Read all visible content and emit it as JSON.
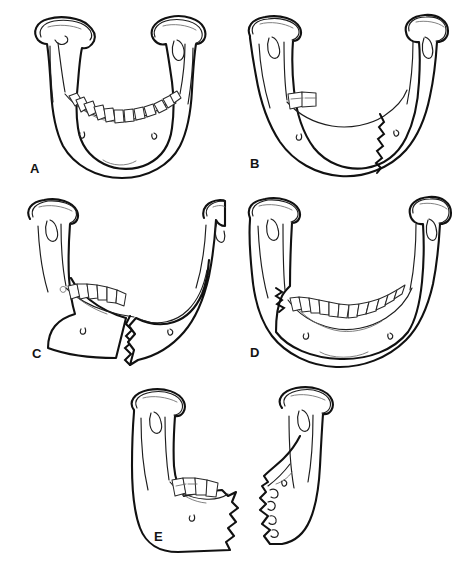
{
  "figure": {
    "background_color": "#ffffff",
    "ink_color": "#111111",
    "top_strip_text": ""
  },
  "panels": [
    {
      "id": "A",
      "label": "A",
      "caption": "Intact dentate mandible, frontal view",
      "dentition": "full",
      "tooth_count": 14,
      "fracture": "none",
      "fragments": 1
    },
    {
      "id": "B",
      "label": "B",
      "caption": "Edentulous mandible with oblique body fracture, two remaining molars",
      "dentition": "edentulous-with-two-molars",
      "tooth_count": 2,
      "fracture": "right-body-oblique",
      "fragments": 2
    },
    {
      "id": "C",
      "label": "C",
      "caption": "Partially dentate mandible with displaced parasymphyseal fracture",
      "dentition": "partial-left",
      "tooth_count": 6,
      "fracture": "parasymphyseal-displaced",
      "fragments": 2
    },
    {
      "id": "D",
      "label": "D",
      "caption": "Dentate mandible with left angle / ramus fracture",
      "dentition": "full",
      "tooth_count": 14,
      "fracture": "left-angle-ramus",
      "fragments": 2
    },
    {
      "id": "E",
      "label": "E",
      "caption": "Lateral views of two separated mandibular fragments, comminuted edges",
      "dentition": "partial-posterior",
      "tooth_count": 4,
      "fracture": "segmental-comminuted",
      "fragments": 2
    }
  ],
  "labels": {
    "a": "A",
    "b": "B",
    "c": "C",
    "d": "D",
    "e": "E"
  }
}
